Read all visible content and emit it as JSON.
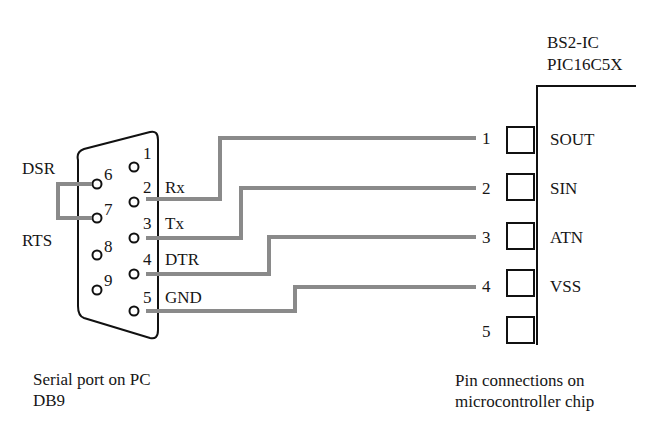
{
  "chip": {
    "title_line1": "BS2-IC",
    "title_line2": "PIC16C5X",
    "pins": [
      {
        "number": "1",
        "label": "SOUT"
      },
      {
        "number": "2",
        "label": "SIN"
      },
      {
        "number": "3",
        "label": "ATN"
      },
      {
        "number": "4",
        "label": "VSS"
      },
      {
        "number": "5",
        "label": ""
      }
    ],
    "caption_line1": "Pin connections on",
    "caption_line2": "microcontroller chip"
  },
  "db9": {
    "pins": [
      {
        "number": "1",
        "label": ""
      },
      {
        "number": "2",
        "label": "Rx"
      },
      {
        "number": "3",
        "label": "Tx"
      },
      {
        "number": "4",
        "label": "DTR"
      },
      {
        "number": "5",
        "label": "GND"
      },
      {
        "number": "6",
        "label": "DSR"
      },
      {
        "number": "7",
        "label": "RTS"
      },
      {
        "number": "8",
        "label": ""
      },
      {
        "number": "9",
        "label": ""
      }
    ],
    "caption_line1": "Serial port on PC",
    "caption_line2": "DB9"
  },
  "connections": [
    {
      "from": "DB9 pin 2 (Rx)",
      "to": "chip pin 1 (SOUT)"
    },
    {
      "from": "DB9 pin 3 (Tx)",
      "to": "chip pin 2 (SIN)"
    },
    {
      "from": "DB9 pin 4 (DTR)",
      "to": "chip pin 3 (ATN)"
    },
    {
      "from": "DB9 pin 5 (GND)",
      "to": "chip pin 4 (VSS)"
    },
    {
      "from": "DB9 pin 6 (DSR)",
      "to": "DB9 pin 7 (RTS)"
    }
  ],
  "colors": {
    "wire": "#8a8a8a",
    "outline": "#111111"
  }
}
